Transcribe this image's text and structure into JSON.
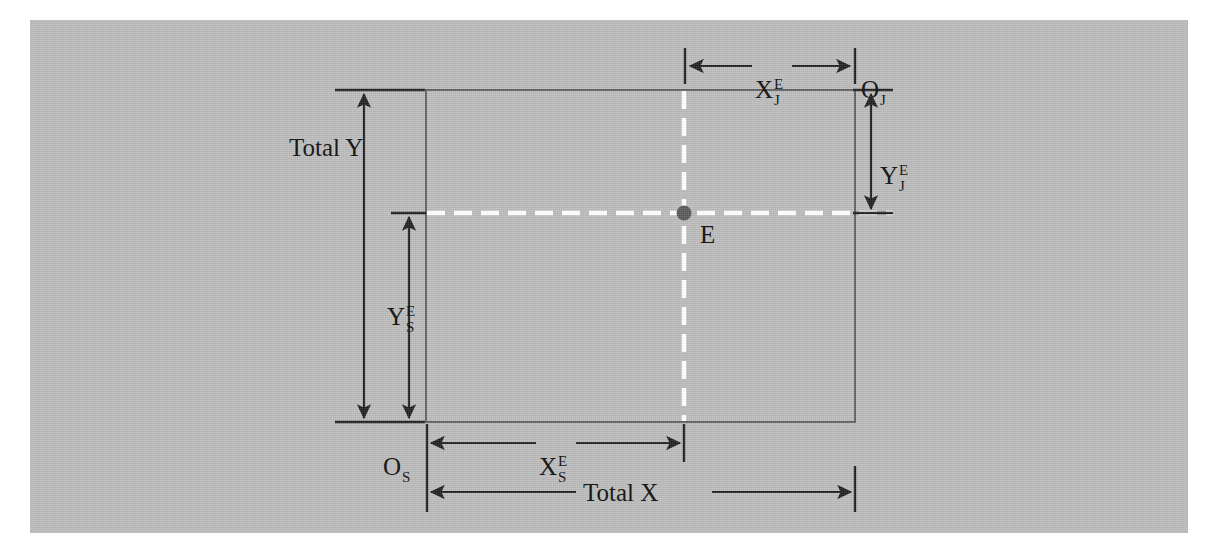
{
  "figure": {
    "background_color": "#b8b8b8",
    "page_color": "#ffffff",
    "line_color": "#1a1a1a",
    "rect_line_color": "#5a5a5a",
    "dash_color": "#ffffff",
    "point_color": "#555555"
  },
  "labels": {
    "total_y": "Total Y",
    "total_x": "Total X",
    "point_e": "E",
    "origin_s": {
      "base": "O",
      "sub": "S"
    },
    "origin_j": {
      "base": "O",
      "sub": "J"
    },
    "x_e_j": {
      "base": "X",
      "sup": "E",
      "sub": "J"
    },
    "y_e_j": {
      "base": "Y",
      "sup": "E",
      "sub": "J"
    },
    "x_e_s": {
      "base": "X",
      "sup": "E",
      "sub": "S"
    },
    "y_e_s": {
      "base": "Y",
      "sup": "E",
      "sub": "S"
    }
  },
  "geometry": {
    "gray_panel": {
      "x": 30,
      "y": 20,
      "width": 1158,
      "height": 513
    },
    "box": {
      "left": 426,
      "top": 90,
      "right": 855,
      "bottom": 422
    },
    "point_e": {
      "x": 684,
      "y": 213
    },
    "dimension_total_y": {
      "x": 364,
      "y_top": 90,
      "y_bottom": 422
    },
    "dimension_y_e_s": {
      "x": 409,
      "y_top": 213,
      "y_bottom": 422
    },
    "dimension_y_e_j": {
      "x": 871,
      "y_top": 90,
      "y_bottom": 213
    },
    "dimension_x_e_j": {
      "y": 66,
      "x_left": 685,
      "x_right": 855
    },
    "dimension_x_e_s": {
      "y": 443,
      "x_left": 427,
      "x_right": 684
    },
    "dimension_total_x": {
      "y": 492,
      "x_left": 427,
      "x_right": 855
    }
  }
}
